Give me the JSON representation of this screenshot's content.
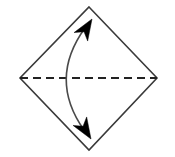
{
  "figure": {
    "canvas": {
      "width": 175,
      "height": 157,
      "background": "#ffffff"
    },
    "colors": {
      "outline": "#3a3a3a",
      "dashed_axis": "#222222",
      "arc": "#4a4a4a",
      "arrowhead_fill": "#000000",
      "background": "#ffffff"
    },
    "shapes": {
      "diamond": {
        "name": "diamond-outline",
        "description": "Quadrilateral (rotated square) drawn with thin dark outline, no fill",
        "stroke_width": 1.6,
        "fill": "none",
        "vertices": [
          {
            "label": "top",
            "x": 89,
            "y": 7
          },
          {
            "label": "right",
            "x": 157,
            "y": 78
          },
          {
            "label": "bottom",
            "x": 89,
            "y": 150
          },
          {
            "label": "left",
            "x": 20,
            "y": 78
          }
        ]
      },
      "dashed_axis": {
        "name": "horizontal-dashed-axis",
        "description": "Horizontal dashed line joining the left and right vertices",
        "x1": 20,
        "y1": 78,
        "x2": 157,
        "y2": 78,
        "stroke_width": 1.8,
        "dash_length": 8,
        "gap_length": 5
      },
      "curved_arrow": {
        "name": "double-headed-curved-arrow",
        "description": "Single arc bowing left, crossing the dashed axis, with solid barbed arrowheads at both ends pointing toward the top and bottom vertices",
        "stroke_width": 1.6,
        "fill": "none",
        "start": {
          "x": 84,
          "y": 130
        },
        "end": {
          "x": 85,
          "y": 28
        },
        "control": {
          "x": 48,
          "y": 79
        },
        "axis_crossing": {
          "x": 65,
          "y": 78
        },
        "leftmost_extent_x": 64,
        "arrowheads": [
          {
            "label": "top-arrowhead",
            "tip": {
              "x": 92,
              "y": 19
            },
            "direction_degrees": 58,
            "length": 21,
            "half_width": 8,
            "notch": 6
          },
          {
            "label": "bottom-arrowhead",
            "tip": {
              "x": 91,
              "y": 139
            },
            "direction_degrees": -58,
            "length": 21,
            "half_width": 8,
            "notch": 6
          }
        ]
      }
    },
    "labels": []
  }
}
